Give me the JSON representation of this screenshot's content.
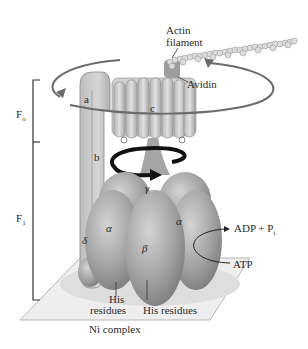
{
  "diagram": {
    "labels": {
      "actin": "Actin",
      "filament": "filament",
      "avidin": "Avidin",
      "f_o_main": "F",
      "f_o_sub": "o",
      "f_1_main": "F",
      "f_1_sub": "1",
      "subunit_a": "a",
      "subunit_b": "b",
      "subunit_c": "c",
      "subunit_gamma": "γ",
      "subunit_delta": "δ",
      "subunit_alpha_left": "α",
      "subunit_alpha_right": "α",
      "subunit_beta": "β",
      "adp": "ADP + P",
      "adp_sub": "i",
      "atp": "ATP",
      "his_left_1": "His",
      "his_left_2": "residues",
      "his_right": "His residues",
      "ni_complex": "Ni complex"
    },
    "colors": {
      "protein_gray": "#9a9a9a",
      "light_gray": "#c8c8c8",
      "arrow_black": "#111111",
      "line_gray": "#6b6b6b",
      "plate": "#ececec"
    }
  }
}
